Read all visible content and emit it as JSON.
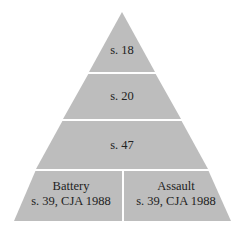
{
  "diagram": {
    "type": "pyramid",
    "fill_color": "#bdbdbd",
    "divider_color": "#ffffff",
    "tiers": [
      {
        "label": "s. 18"
      },
      {
        "label": "s. 20"
      },
      {
        "label": "s. 47"
      }
    ],
    "base": {
      "left": {
        "line1": "Battery",
        "line2": "s. 39, CJA 1988"
      },
      "right": {
        "line1": "Assault",
        "line2": "s. 39, CJA 1988"
      }
    }
  }
}
